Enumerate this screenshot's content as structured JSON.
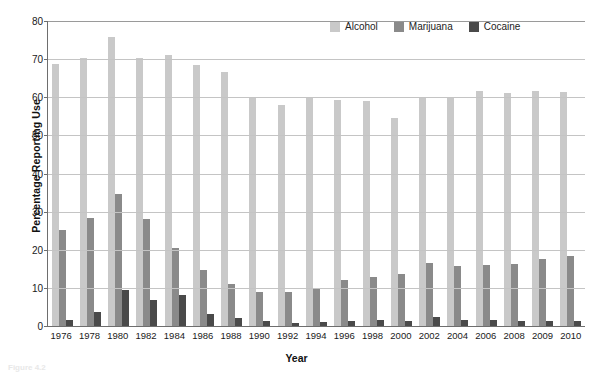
{
  "chart_data": {
    "type": "bar",
    "title": "",
    "xlabel": "Year",
    "ylabel": "Percentage Reporting Use",
    "ylim": [
      0,
      80
    ],
    "yticks": [
      0,
      10,
      20,
      30,
      40,
      50,
      60,
      70,
      80
    ],
    "grid": true,
    "legend_position": "top-right",
    "categories": [
      "1976",
      "1978",
      "1980",
      "1982",
      "1984",
      "1986",
      "1988",
      "1990",
      "1992",
      "1994",
      "1996",
      "1998",
      "2000",
      "2002",
      "2004",
      "2006",
      "2008",
      "2009",
      "2010"
    ],
    "series": [
      {
        "name": "Alcohol",
        "color": "#c9c9c9",
        "values": [
          68.5,
          70.0,
          75.5,
          70.0,
          70.8,
          68.2,
          66.4,
          60.0,
          57.9,
          60.0,
          59.0,
          58.9,
          54.5,
          60.0,
          60.0,
          61.5,
          61.0,
          61.5,
          61.2
        ]
      },
      {
        "name": "Marijuana",
        "color": "#8a8a8a",
        "values": [
          25.2,
          28.2,
          34.6,
          27.9,
          20.3,
          14.6,
          11.1,
          9.0,
          8.8,
          9.8,
          12.1,
          12.9,
          13.6,
          16.6,
          15.6,
          16.0,
          16.1,
          17.6,
          18.2
        ]
      },
      {
        "name": "Cocaine",
        "color": "#4a4a4a",
        "values": [
          1.5,
          3.6,
          9.3,
          6.7,
          8.0,
          3.1,
          2.1,
          1.2,
          0.9,
          1.0,
          1.3,
          1.5,
          1.3,
          2.3,
          1.6,
          1.5,
          1.4,
          1.3,
          1.4
        ]
      }
    ]
  },
  "legend": {
    "items": [
      {
        "label": "Alcohol",
        "color": "#c9c9c9"
      },
      {
        "label": "Marijuana",
        "color": "#8a8a8a"
      },
      {
        "label": "Cocaine",
        "color": "#4a4a4a"
      }
    ]
  },
  "axes": {
    "y_title": "Percentage Reporting Use",
    "x_title": "Year"
  },
  "caption": "Figure 4.2"
}
